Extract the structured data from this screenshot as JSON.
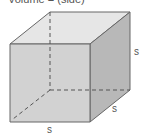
{
  "title": "Volume = (side)³",
  "labels": {
    "height": "s",
    "depth": "s",
    "width": "s"
  },
  "colors": {
    "front": "#cfcfcf",
    "top": "#e6e6e6",
    "side": "#b3b3b3",
    "edge": "#666666"
  }
}
